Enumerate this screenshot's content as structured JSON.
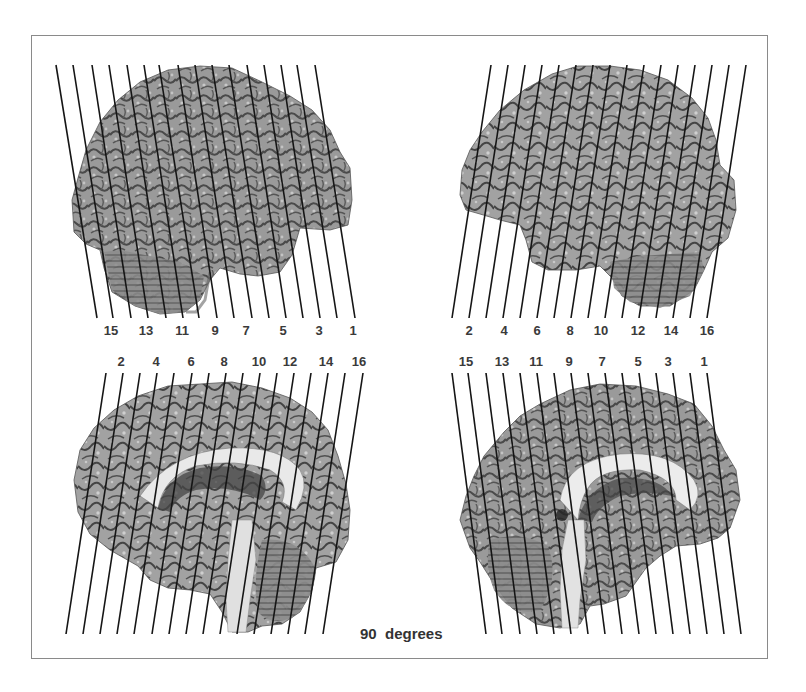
{
  "figure": {
    "caption": "90  degrees",
    "frame_color": "#8a8a8a",
    "line_color": "#151515",
    "panels": [
      {
        "id": "top-left",
        "view": "lateral surface, left-facing",
        "line_direction": "slant down-right",
        "labels": [
          {
            "text": "15",
            "x": 111,
            "y": 324
          },
          {
            "text": "13",
            "x": 146,
            "y": 324
          },
          {
            "text": "11",
            "x": 182,
            "y": 324
          },
          {
            "text": "9",
            "x": 215,
            "y": 324
          },
          {
            "text": "7",
            "x": 246,
            "y": 324
          },
          {
            "text": "5",
            "x": 283,
            "y": 324
          },
          {
            "text": "3",
            "x": 319,
            "y": 324
          },
          {
            "text": "1",
            "x": 353,
            "y": 324
          }
        ]
      },
      {
        "id": "top-right",
        "view": "lateral surface, right-facing",
        "line_direction": "slant down-left",
        "labels": [
          {
            "text": "2",
            "x": 469,
            "y": 324
          },
          {
            "text": "4",
            "x": 504,
            "y": 324
          },
          {
            "text": "6",
            "x": 537,
            "y": 324
          },
          {
            "text": "8",
            "x": 570,
            "y": 324
          },
          {
            "text": "10",
            "x": 601,
            "y": 324
          },
          {
            "text": "12",
            "x": 638,
            "y": 324
          },
          {
            "text": "14",
            "x": 671,
            "y": 324
          },
          {
            "text": "16",
            "x": 707,
            "y": 324
          }
        ]
      },
      {
        "id": "bottom-left",
        "view": "medial surface, left-facing",
        "line_direction": "slant down-left",
        "labels": [
          {
            "text": "2",
            "x": 121,
            "y": 355
          },
          {
            "text": "4",
            "x": 156,
            "y": 355
          },
          {
            "text": "6",
            "x": 191,
            "y": 355
          },
          {
            "text": "8",
            "x": 224,
            "y": 355
          },
          {
            "text": "10",
            "x": 259,
            "y": 355
          },
          {
            "text": "12",
            "x": 290,
            "y": 355
          },
          {
            "text": "14",
            "x": 326,
            "y": 355
          },
          {
            "text": "16",
            "x": 359,
            "y": 355
          }
        ]
      },
      {
        "id": "bottom-right",
        "view": "medial surface, right-facing",
        "line_direction": "slant down-right",
        "labels": [
          {
            "text": "15",
            "x": 466,
            "y": 355
          },
          {
            "text": "13",
            "x": 502,
            "y": 355
          },
          {
            "text": "11",
            "x": 536,
            "y": 355
          },
          {
            "text": "9",
            "x": 569,
            "y": 355
          },
          {
            "text": "7",
            "x": 602,
            "y": 355
          },
          {
            "text": "5",
            "x": 638,
            "y": 355
          },
          {
            "text": "3",
            "x": 668,
            "y": 355
          },
          {
            "text": "1",
            "x": 704,
            "y": 355
          }
        ]
      }
    ]
  }
}
